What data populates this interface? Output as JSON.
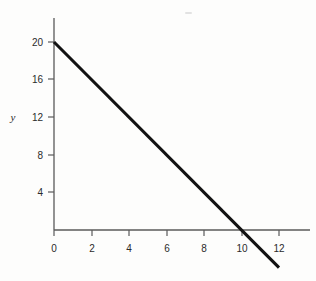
{
  "chart_data": {
    "type": "line",
    "title": "",
    "subtitle": "",
    "xlabel": "",
    "ylabel": "y",
    "grid": false,
    "legend": false,
    "equation": "y = 20 - 2x",
    "xlim": [
      -0.6,
      13.6
    ],
    "ylim": [
      -5.2,
      22.5
    ],
    "x_ticks": [
      0,
      2,
      4,
      6,
      8,
      10,
      12
    ],
    "x_tick_labels": [
      "0",
      "2",
      "4",
      "6",
      "8",
      "10",
      "12"
    ],
    "y_ticks": [
      4,
      8,
      12,
      16,
      20
    ],
    "y_tick_labels": [
      "4",
      "8",
      "12",
      "16",
      "20"
    ],
    "series": [
      {
        "name": "y = 20 - 2x",
        "x": [
          0,
          12
        ],
        "values": [
          20,
          -4
        ],
        "color": "#121212",
        "points": [
          {
            "x": 0,
            "y": 20
          },
          {
            "x": 2,
            "y": 16
          },
          {
            "x": 4,
            "y": 12
          },
          {
            "x": 6,
            "y": 8
          },
          {
            "x": 8,
            "y": 4
          },
          {
            "x": 10,
            "y": 0
          },
          {
            "x": 12,
            "y": -4
          }
        ],
        "y_intercept": 20,
        "x_intercept": 10,
        "slope": -2
      }
    ]
  },
  "axis": {
    "y_label": "y"
  },
  "labels": {
    "y": {
      "t20": "20",
      "t16": "16",
      "t12": "12",
      "t8": "8",
      "t4": "4"
    },
    "x": {
      "t0": "0",
      "t2": "2",
      "t4": "4",
      "t6": "6",
      "t8": "8",
      "t10": "10",
      "t12": "12"
    }
  },
  "colors": {
    "background": "#fdfdfc",
    "axis": "#5a5a5a",
    "line": "#121212",
    "text": "#2b2b2b"
  }
}
